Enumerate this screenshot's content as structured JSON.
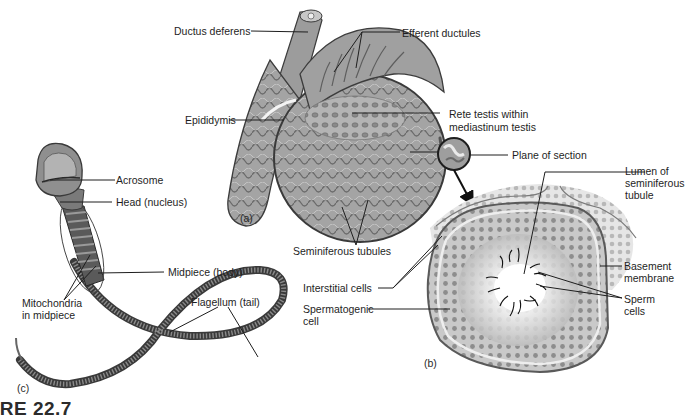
{
  "figure": {
    "caption": "IRE 22.7",
    "panels": [
      {
        "id": "a",
        "label": "(a)",
        "subject": "testis-sagittal-section"
      },
      {
        "id": "b",
        "label": "(b)",
        "subject": "seminiferous-tubule-cross-section"
      },
      {
        "id": "c",
        "label": "(c)",
        "subject": "sperm-cell"
      }
    ]
  },
  "labels": {
    "ductus_deferens": "Ductus deferens",
    "efferent_ductules": "Efferent ductules",
    "epididymis": "Epididymis",
    "rete_testis_1": "Rete testis within",
    "rete_testis_2": "mediastinum testis",
    "plane_of_section": "Plane of section",
    "lumen_1": "Lumen of",
    "lumen_2": "seminiferous",
    "lumen_3": "tubule",
    "seminiferous_tubules": "Seminiferous tubules",
    "interstitial_cells": "Interstitial cells",
    "spermatogenic_1": "Spermatogenic",
    "spermatogenic_2": "cell",
    "basement_1": "Basement",
    "basement_2": "membrane",
    "sperm_cells_1": "Sperm",
    "sperm_cells_2": "cells",
    "acrosome": "Acrosome",
    "head": "Head (nucleus)",
    "midpiece": "Midpiece (body)",
    "mitochondria_1": "Mitochondria",
    "mitochondria_2": "in midpiece",
    "flagellum": "Flagellum (tail)",
    "panel_a": "(a)",
    "panel_b": "(b)",
    "panel_c": "(c)"
  },
  "colors": {
    "background": "#ffffff",
    "tissue_fill": "#a9a9a9",
    "tissue_dark": "#6e6e6e",
    "outline": "#3c3c3c",
    "leader_line": "#1e1e1e",
    "tubule_lumen": "#f4f4f4"
  }
}
